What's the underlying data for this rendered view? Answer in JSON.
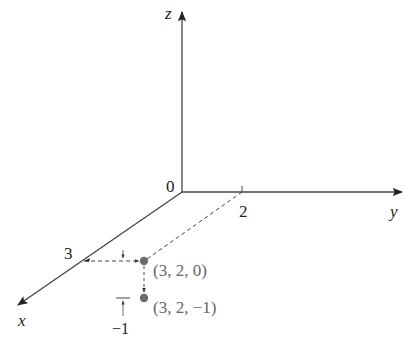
{
  "diagram": {
    "type": "3d-coordinate-axes",
    "axes": {
      "x": {
        "label": "x"
      },
      "y": {
        "label": "y"
      },
      "z": {
        "label": "z"
      }
    },
    "origin_label": "0",
    "ticks": {
      "x": "3",
      "y": "2",
      "z_offset": "−1"
    },
    "points": [
      {
        "label": "(3, 2, 0)",
        "coords": [
          3,
          2,
          0
        ]
      },
      {
        "label": "(3, 2, −1)",
        "coords": [
          3,
          2,
          -1
        ]
      }
    ],
    "colors": {
      "axis": "#333333",
      "point": "#6b6b6b",
      "point_label": "#666666",
      "dashed": "#333333"
    }
  }
}
